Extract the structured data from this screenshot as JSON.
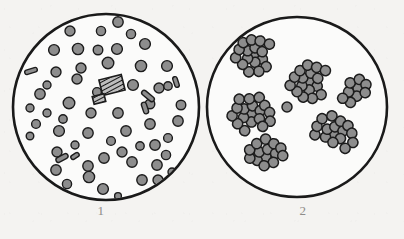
{
  "figure": {
    "background_color": "#f4f3f1",
    "outline_color": "#1a1a1a",
    "particle_fill": "#8d8d8d",
    "particle_stroke": "#1c1c1c",
    "label_color": "#8e8c8a"
  },
  "panels": [
    {
      "id": "panel-1",
      "label": "1",
      "description": "Evenly dispersed round particles with a few rod-shaped and hatched rectangular elements",
      "circle": {
        "cx": 106,
        "cy": 107,
        "r": 93,
        "stroke_width": 2.6
      },
      "counts": {
        "round_particles": 56,
        "rods": 6,
        "hatched_blocks": 2
      },
      "round_particles": [
        {
          "x": 118,
          "y": 22,
          "r": 5.2
        },
        {
          "x": 70,
          "y": 31,
          "r": 5.0
        },
        {
          "x": 101,
          "y": 31,
          "r": 4.6
        },
        {
          "x": 145,
          "y": 44,
          "r": 5.4
        },
        {
          "x": 54,
          "y": 50,
          "r": 5.4
        },
        {
          "x": 78,
          "y": 49,
          "r": 5.6
        },
        {
          "x": 98,
          "y": 50,
          "r": 4.8
        },
        {
          "x": 117,
          "y": 49,
          "r": 5.4
        },
        {
          "x": 81,
          "y": 68,
          "r": 5.0
        },
        {
          "x": 108,
          "y": 63,
          "r": 5.8
        },
        {
          "x": 141,
          "y": 66,
          "r": 5.6
        },
        {
          "x": 167,
          "y": 66,
          "r": 5.4
        },
        {
          "x": 56,
          "y": 72,
          "r": 5.0
        },
        {
          "x": 159,
          "y": 88,
          "r": 5.0
        },
        {
          "x": 77,
          "y": 79,
          "r": 5.0
        },
        {
          "x": 133,
          "y": 85,
          "r": 5.4
        },
        {
          "x": 40,
          "y": 94,
          "r": 5.2
        },
        {
          "x": 69,
          "y": 103,
          "r": 5.8
        },
        {
          "x": 91,
          "y": 113,
          "r": 5.0
        },
        {
          "x": 118,
          "y": 113,
          "r": 5.2
        },
        {
          "x": 181,
          "y": 105,
          "r": 4.8
        },
        {
          "x": 178,
          "y": 121,
          "r": 5.2
        },
        {
          "x": 36,
          "y": 124,
          "r": 4.4
        },
        {
          "x": 59,
          "y": 131,
          "r": 5.4
        },
        {
          "x": 88,
          "y": 133,
          "r": 5.2
        },
        {
          "x": 126,
          "y": 131,
          "r": 5.2
        },
        {
          "x": 150,
          "y": 124,
          "r": 5.2
        },
        {
          "x": 155,
          "y": 145,
          "r": 5.2
        },
        {
          "x": 57,
          "y": 152,
          "r": 5.0
        },
        {
          "x": 122,
          "y": 152,
          "r": 5.0
        },
        {
          "x": 168,
          "y": 138,
          "r": 4.4
        },
        {
          "x": 56,
          "y": 170,
          "r": 5.2
        },
        {
          "x": 88,
          "y": 166,
          "r": 5.2
        },
        {
          "x": 104,
          "y": 158,
          "r": 5.2
        },
        {
          "x": 132,
          "y": 162,
          "r": 5.2
        },
        {
          "x": 157,
          "y": 165,
          "r": 5.2
        },
        {
          "x": 166,
          "y": 155,
          "r": 4.6
        },
        {
          "x": 89,
          "y": 177,
          "r": 5.6
        },
        {
          "x": 67,
          "y": 184,
          "r": 4.6
        },
        {
          "x": 103,
          "y": 189,
          "r": 5.4
        },
        {
          "x": 142,
          "y": 180,
          "r": 5.2
        },
        {
          "x": 158,
          "y": 180,
          "r": 5.0
        },
        {
          "x": 118,
          "y": 196,
          "r": 3.4
        },
        {
          "x": 30,
          "y": 108,
          "r": 4.0
        },
        {
          "x": 150,
          "y": 104,
          "r": 4.8
        },
        {
          "x": 97,
          "y": 92,
          "r": 4.4
        },
        {
          "x": 168,
          "y": 86,
          "r": 4.2
        },
        {
          "x": 47,
          "y": 113,
          "r": 4.0
        },
        {
          "x": 30,
          "y": 136,
          "r": 3.8
        },
        {
          "x": 75,
          "y": 145,
          "r": 4.0
        },
        {
          "x": 111,
          "y": 141,
          "r": 4.4
        },
        {
          "x": 140,
          "y": 146,
          "r": 4.2
        },
        {
          "x": 172,
          "y": 172,
          "r": 4.0
        },
        {
          "x": 47,
          "y": 85,
          "r": 4.0
        },
        {
          "x": 131,
          "y": 34,
          "r": 4.6
        },
        {
          "x": 63,
          "y": 119,
          "r": 4.2
        }
      ],
      "rods": [
        {
          "x": 31,
          "y": 71,
          "w": 13,
          "h": 4.5,
          "rot": -18
        },
        {
          "x": 176,
          "y": 82,
          "w": 11,
          "h": 4.5,
          "rot": 72
        },
        {
          "x": 148,
          "y": 96,
          "w": 15,
          "h": 5,
          "rot": 40
        },
        {
          "x": 145,
          "y": 108,
          "w": 12,
          "h": 5,
          "rot": 72
        },
        {
          "x": 62,
          "y": 158,
          "w": 13,
          "h": 5,
          "rot": -28
        },
        {
          "x": 75,
          "y": 156,
          "w": 9,
          "h": 4.5,
          "rot": -32
        }
      ],
      "hatched_blocks": [
        {
          "x": 112,
          "y": 85,
          "w": 23,
          "h": 16,
          "rot": -14,
          "stripes": 6
        },
        {
          "x": 99,
          "y": 99,
          "w": 12,
          "h": 8,
          "rot": -14,
          "stripes": 4
        }
      ]
    },
    {
      "id": "panel-2",
      "label": "2",
      "description": "Particles aggregated into six grape-like clusters plus one isolated particle",
      "circle": {
        "cx": 297,
        "cy": 107,
        "r": 90,
        "stroke_width": 2.6
      },
      "counts": {
        "clusters": 6,
        "isolated_particles": 1,
        "total_particles": 91
      },
      "clusters": [
        {
          "name": "cluster-upper-left",
          "cx": 255,
          "cy": 55,
          "count": 17
        },
        {
          "name": "cluster-center",
          "cx": 310,
          "cy": 82,
          "count": 17
        },
        {
          "name": "cluster-mid-left",
          "cx": 252,
          "cy": 114,
          "count": 18
        },
        {
          "name": "cluster-right-upper",
          "cx": 358,
          "cy": 88,
          "count": 9
        },
        {
          "name": "cluster-lower-right",
          "cx": 334,
          "cy": 134,
          "count": 16
        },
        {
          "name": "cluster-lower-left",
          "cx": 266,
          "cy": 157,
          "count": 14
        }
      ],
      "isolated_particles": [
        {
          "x": 287,
          "y": 107,
          "r": 5.0
        }
      ]
    }
  ]
}
